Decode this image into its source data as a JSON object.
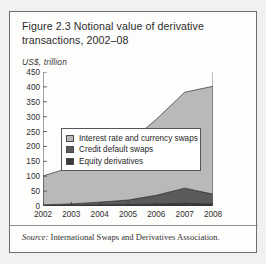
{
  "figure": {
    "title": "Figure 2.3  Notional value of derivative transactions, 2002–08",
    "unit_label": "US$, trillion",
    "source_prefix": "Source:",
    "source_text": "International Swaps and Derivatives Association."
  },
  "colors": {
    "panel_background": "#f2f1ef",
    "figure_background": "#fdfdfc",
    "frame": "#6e6e6e",
    "series_interest_rate": "#b9b9b9",
    "series_credit_default": "#5a5a5a",
    "series_equity": "#3a3a3a",
    "axis": "#555555",
    "text": "#2c2c2c"
  },
  "legend": {
    "items": [
      {
        "label": "Interest rate and currency swaps",
        "color": "#b9b9b9"
      },
      {
        "label": "Credit default swaps",
        "color": "#5a5a5a"
      },
      {
        "label": "Equity derivatives",
        "color": "#3a3a3a"
      }
    ]
  },
  "chart_data": {
    "type": "area",
    "stacked": true,
    "title": "Figure 2.3  Notional value of derivative transactions, 2002–08",
    "xlabel": "",
    "ylabel": "US$, trillion",
    "categories": [
      "2002",
      "2003",
      "2004",
      "2005",
      "2006",
      "2007",
      "2008"
    ],
    "x": [
      2002,
      2003,
      2004,
      2005,
      2006,
      2007,
      2008
    ],
    "ylim": [
      0,
      450
    ],
    "yticks": [
      0,
      50,
      100,
      150,
      200,
      250,
      300,
      350,
      400,
      450
    ],
    "grid": false,
    "legend_position": "top-left-inside",
    "series": [
      {
        "name": "Equity derivatives",
        "color": "#3a3a3a",
        "values": [
          2,
          3,
          4,
          5,
          7,
          9,
          7
        ]
      },
      {
        "name": "Credit default swaps",
        "color": "#5a5a5a",
        "values": [
          2,
          4,
          9,
          15,
          29,
          51,
          33
        ]
      },
      {
        "name": "Interest rate and currency swaps",
        "color": "#b9b9b9",
        "values": [
          97,
          123,
          174,
          190,
          255,
          322,
          362
        ]
      }
    ],
    "totals": [
      101,
      130,
      187,
      210,
      291,
      382,
      402
    ],
    "annotations": []
  }
}
